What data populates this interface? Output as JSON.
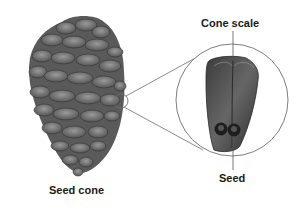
{
  "diagram": {
    "labels": {
      "seed_cone": "Seed cone",
      "cone_scale": "Cone scale",
      "seed": "Seed"
    },
    "colors": {
      "background": "#ffffff",
      "scale_fill": "#7a7a7a",
      "scale_dark": "#3a3a3a",
      "line": "#6e6e6e",
      "text": "#1a1a1a"
    },
    "nodes": [
      {
        "id": "seed-cone",
        "label": "Seed cone",
        "kind": "illustration"
      },
      {
        "id": "magnified-scale",
        "label": "Cone scale",
        "kind": "inset-circle"
      },
      {
        "id": "seed",
        "label": "Seed",
        "kind": "part"
      }
    ],
    "edges": [
      {
        "from": "seed-cone",
        "to": "magnified-scale",
        "kind": "zoom-callout"
      }
    ]
  }
}
